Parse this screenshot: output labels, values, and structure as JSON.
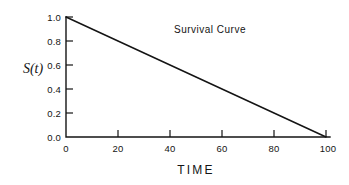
{
  "chart_data": {
    "type": "line",
    "title": "Survival Curve",
    "xlabel": "TIME",
    "ylabel": "S(t)",
    "xlim": [
      0,
      100
    ],
    "ylim": [
      0.0,
      1.0
    ],
    "grid": false,
    "legend": "none",
    "x_ticks": [
      "0",
      "20",
      "40",
      "60",
      "80",
      "100"
    ],
    "x_tick_values": [
      0,
      20,
      40,
      60,
      80,
      100
    ],
    "y_ticks": [
      "1.0",
      "0.8",
      "0.6",
      "0.4",
      "0.2",
      "0.0"
    ],
    "y_tick_values": [
      1.0,
      0.8,
      0.6,
      0.4,
      0.2,
      0.0
    ],
    "series": [
      {
        "name": "Survival Curve",
        "x": [
          0,
          10,
          20,
          30,
          40,
          50,
          60,
          70,
          80,
          90,
          100
        ],
        "values": [
          1.0,
          0.9,
          0.8,
          0.7,
          0.6,
          0.5,
          0.4,
          0.3,
          0.2,
          0.1,
          0.0
        ]
      }
    ],
    "colors": {
      "line": "#141414",
      "axis": "#141414",
      "background": "#ffffff",
      "text": "#141414"
    }
  }
}
